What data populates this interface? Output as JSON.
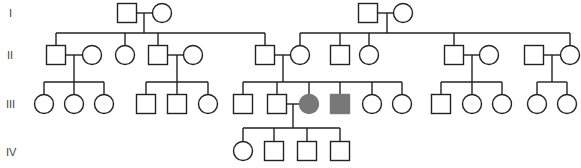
{
  "colors": {
    "line": "#222222",
    "affected": "#787878",
    "unaffected": "#ffffff"
  },
  "generations": [
    {
      "label": "I",
      "y": 13
    },
    {
      "label": "II",
      "y": 55
    },
    {
      "label": "III",
      "y": 104
    },
    {
      "label": "IV",
      "y": 151
    }
  ],
  "individuals": [
    {
      "id": "I-1",
      "gen": "I",
      "sex": "male",
      "x": 127,
      "y": 13,
      "affected": false
    },
    {
      "id": "I-2",
      "gen": "I",
      "sex": "female",
      "x": 162,
      "y": 13,
      "affected": false
    },
    {
      "id": "I-3",
      "gen": "I",
      "sex": "male",
      "x": 368,
      "y": 13,
      "affected": false
    },
    {
      "id": "I-4",
      "gen": "I",
      "sex": "female",
      "x": 403,
      "y": 13,
      "affected": false
    },
    {
      "id": "II-1",
      "gen": "II",
      "sex": "male",
      "x": 56,
      "y": 55,
      "affected": false
    },
    {
      "id": "II-2",
      "gen": "II",
      "sex": "female",
      "x": 92,
      "y": 55,
      "affected": false
    },
    {
      "id": "II-3",
      "gen": "II",
      "sex": "female",
      "x": 125,
      "y": 55,
      "affected": false
    },
    {
      "id": "II-4",
      "gen": "II",
      "sex": "male",
      "x": 158,
      "y": 55,
      "affected": false
    },
    {
      "id": "II-5",
      "gen": "II",
      "sex": "female",
      "x": 193,
      "y": 55,
      "affected": false
    },
    {
      "id": "II-6",
      "gen": "II",
      "sex": "male",
      "x": 265,
      "y": 55,
      "affected": false
    },
    {
      "id": "II-7",
      "gen": "II",
      "sex": "female",
      "x": 300,
      "y": 55,
      "affected": false
    },
    {
      "id": "II-8",
      "gen": "II",
      "sex": "male",
      "x": 340,
      "y": 55,
      "affected": false
    },
    {
      "id": "II-9",
      "gen": "II",
      "sex": "female",
      "x": 369,
      "y": 55,
      "affected": false
    },
    {
      "id": "II-10",
      "gen": "II",
      "sex": "male",
      "x": 454,
      "y": 55,
      "affected": false
    },
    {
      "id": "II-11",
      "gen": "II",
      "sex": "female",
      "x": 489,
      "y": 55,
      "affected": false
    },
    {
      "id": "II-12",
      "gen": "II",
      "sex": "male",
      "x": 534,
      "y": 55,
      "affected": false
    },
    {
      "id": "II-13",
      "gen": "II",
      "sex": "female",
      "x": 570,
      "y": 55,
      "affected": false
    },
    {
      "id": "III-1",
      "gen": "III",
      "sex": "female",
      "x": 44,
      "y": 104,
      "affected": false
    },
    {
      "id": "III-2",
      "gen": "III",
      "sex": "female",
      "x": 74,
      "y": 104,
      "affected": false
    },
    {
      "id": "III-3",
      "gen": "III",
      "sex": "female",
      "x": 104,
      "y": 104,
      "affected": false
    },
    {
      "id": "III-4",
      "gen": "III",
      "sex": "male",
      "x": 146,
      "y": 104,
      "affected": false
    },
    {
      "id": "III-5",
      "gen": "III",
      "sex": "male",
      "x": 177,
      "y": 104,
      "affected": false
    },
    {
      "id": "III-6",
      "gen": "III",
      "sex": "female",
      "x": 208,
      "y": 104,
      "affected": false
    },
    {
      "id": "III-7",
      "gen": "III",
      "sex": "male",
      "x": 243,
      "y": 104,
      "affected": false
    },
    {
      "id": "III-8",
      "gen": "III",
      "sex": "male",
      "x": 277,
      "y": 104,
      "affected": false
    },
    {
      "id": "III-9",
      "gen": "III",
      "sex": "female",
      "x": 309,
      "y": 104,
      "affected": true
    },
    {
      "id": "III-10",
      "gen": "III",
      "sex": "male",
      "x": 340,
      "y": 104,
      "affected": true
    },
    {
      "id": "III-11",
      "gen": "III",
      "sex": "female",
      "x": 372,
      "y": 104,
      "affected": false
    },
    {
      "id": "III-12",
      "gen": "III",
      "sex": "female",
      "x": 402,
      "y": 104,
      "affected": false
    },
    {
      "id": "III-13",
      "gen": "III",
      "sex": "male",
      "x": 441,
      "y": 104,
      "affected": false
    },
    {
      "id": "III-14",
      "gen": "III",
      "sex": "female",
      "x": 472,
      "y": 104,
      "affected": false
    },
    {
      "id": "III-15",
      "gen": "III",
      "sex": "female",
      "x": 502,
      "y": 104,
      "affected": false
    },
    {
      "id": "III-16",
      "gen": "III",
      "sex": "female",
      "x": 537,
      "y": 104,
      "affected": false
    },
    {
      "id": "III-17",
      "gen": "III",
      "sex": "female",
      "x": 567,
      "y": 104,
      "affected": false
    },
    {
      "id": "IV-1",
      "gen": "IV",
      "sex": "female",
      "x": 243,
      "y": 151,
      "affected": false
    },
    {
      "id": "IV-2",
      "gen": "IV",
      "sex": "male",
      "x": 274,
      "y": 151,
      "affected": false
    },
    {
      "id": "IV-3",
      "gen": "IV",
      "sex": "male",
      "x": 307,
      "y": 151,
      "affected": false
    },
    {
      "id": "IV-4",
      "gen": "IV",
      "sex": "male",
      "x": 340,
      "y": 151,
      "affected": false
    }
  ],
  "families": [
    {
      "parents": [
        "I-1",
        "I-2"
      ],
      "mid_x": 144,
      "sib_y": 33,
      "children_x": [
        56,
        125,
        158,
        265
      ]
    },
    {
      "parents": [
        "I-3",
        "I-4"
      ],
      "mid_x": 387,
      "sib_y": 33,
      "children_x": [
        300,
        340,
        369,
        454,
        570
      ]
    },
    {
      "parents": [
        "II-1",
        "II-2"
      ],
      "mid_x": 74,
      "sib_y": 82,
      "children_x": [
        44,
        74,
        104
      ]
    },
    {
      "parents": [
        "II-4",
        "II-5"
      ],
      "mid_x": 177,
      "sib_y": 82,
      "children_x": [
        146,
        177,
        208
      ]
    },
    {
      "parents": [
        "II-6",
        "II-7"
      ],
      "mid_x": 283,
      "sib_y": 82,
      "children_x": [
        243,
        277,
        309,
        340,
        372,
        402
      ]
    },
    {
      "parents": [
        "II-10",
        "II-11"
      ],
      "mid_x": 472,
      "sib_y": 82,
      "children_x": [
        441,
        472,
        502
      ]
    },
    {
      "parents": [
        "II-12",
        "II-13"
      ],
      "mid_x": 552,
      "sib_y": 82,
      "children_x": [
        537,
        567
      ]
    },
    {
      "parents": [
        "III-8",
        "III-9"
      ],
      "mid_x": 293,
      "sib_y": 128,
      "children_x": [
        243,
        274,
        307,
        340
      ]
    }
  ]
}
